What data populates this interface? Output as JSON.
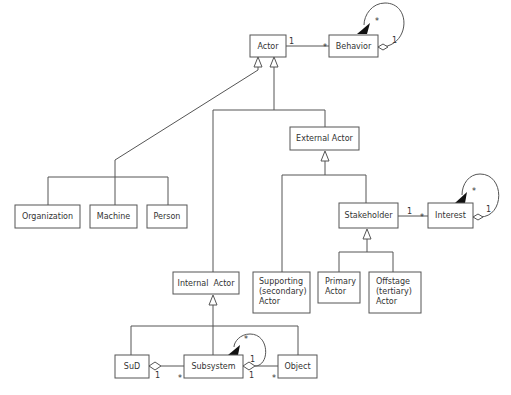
{
  "diagram": {
    "type": "UML class diagram",
    "classes": {
      "actor": {
        "label": "Actor"
      },
      "behavior": {
        "label": "Behavior"
      },
      "organization": {
        "label": "Organization"
      },
      "machine": {
        "label": "Machine"
      },
      "person": {
        "label": "Person"
      },
      "external_actor": {
        "label": "External Actor"
      },
      "stakeholder": {
        "label": "Stakeholder"
      },
      "interest": {
        "label": "Interest"
      },
      "internal_actor": {
        "label": "Internal  Actor"
      },
      "supporting_actor": {
        "lines": [
          "Supporting",
          "(secondary)",
          "Actor"
        ]
      },
      "primary_actor": {
        "lines": [
          "Primary",
          "Actor"
        ]
      },
      "offstage_actor": {
        "lines": [
          "Offstage",
          "(tertiary)",
          "Actor"
        ]
      },
      "sud": {
        "label": "SuD"
      },
      "subsystem": {
        "label": "Subsystem"
      },
      "object": {
        "label": "Object"
      }
    },
    "associations": {
      "actor_behavior": {
        "from_mult": "1",
        "to_mult": "*"
      },
      "behavior_self": {
        "arrow_mult": "*",
        "diamond_mult": "1"
      },
      "stakeholder_interest": {
        "from_mult": "1",
        "to_mult": "*"
      },
      "interest_self": {
        "arrow_mult": "*",
        "diamond_mult": "1"
      },
      "sud_subsystem": {
        "diamond_mult": "1",
        "to_mult": "*"
      },
      "subsystem_self": {
        "arrow_mult": "*",
        "diamond_mult": "1"
      },
      "subsystem_object": {
        "diamond_mult": "1",
        "to_mult": "*"
      }
    },
    "generalizations": [
      {
        "parent": "Actor",
        "children": [
          "Organization",
          "Machine",
          "Person"
        ]
      },
      {
        "parent": "Actor",
        "children": [
          "Internal Actor",
          "External Actor"
        ]
      },
      {
        "parent": "External Actor",
        "children": [
          "Supporting (secondary) Actor",
          "Stakeholder"
        ]
      },
      {
        "parent": "Stakeholder",
        "children": [
          "Primary Actor",
          "Offstage (tertiary) Actor"
        ]
      },
      {
        "parent": "Internal Actor",
        "children": [
          "SuD",
          "Subsystem",
          "Object"
        ]
      }
    ]
  }
}
